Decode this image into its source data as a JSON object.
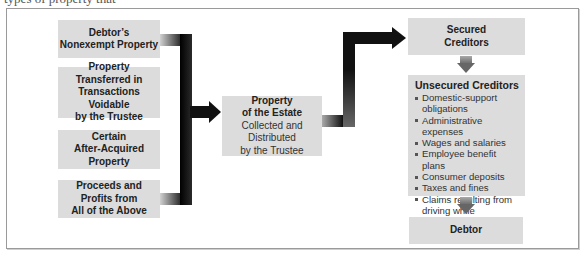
{
  "caption_fragment": "types of property that",
  "diagram": {
    "sources": [
      {
        "lines_bold": [
          "Debtor’s",
          "Nonexempt Property"
        ],
        "lines_normal": []
      },
      {
        "lines_bold": [
          "Property",
          "Transferred in",
          "Transactions Voidable",
          "by the Trustee"
        ],
        "lines_normal": []
      },
      {
        "lines_bold": [
          "Certain",
          "After-Acquired",
          "Property"
        ],
        "lines_normal": []
      },
      {
        "lines_bold": [
          "Proceeds and",
          "Profits from",
          "All of the Above"
        ],
        "lines_normal": []
      }
    ],
    "estate": {
      "lines_bold": [
        "Property",
        "of the Estate"
      ],
      "lines_normal": [
        "Collected and",
        "Distributed",
        "by the Trustee"
      ]
    },
    "secured": {
      "lines_bold": [
        "Secured",
        "Creditors"
      ]
    },
    "unsecured": {
      "title": "Unsecured Creditors",
      "items": [
        "Domestic-support obligations",
        "Administrative expenses",
        "Wages and salaries",
        "Employee benefit plans",
        "Consumer deposits",
        "Taxes and fines",
        "Claims resulting from driving while intoxicated",
        "General creditors"
      ]
    },
    "debtor": {
      "label": "Debtor"
    },
    "colors": {
      "box_fill": "#dcdcdc",
      "connector": "#111111",
      "frame_border": "#9a9a9a"
    }
  }
}
